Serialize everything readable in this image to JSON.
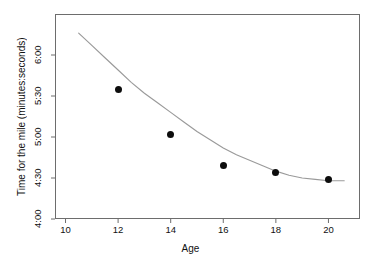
{
  "chart_data": {
    "type": "scatter",
    "title": "",
    "xlabel": "Age",
    "ylabel": "Time for the mile (minutes:seconds)",
    "xlim": [
      9.6,
      21.2
    ],
    "ylim": [
      240,
      390
    ],
    "grid": false,
    "legend": null,
    "x": [
      12,
      14,
      16,
      18,
      20
    ],
    "y_labels": [
      "5:35",
      "5:02",
      "4:39",
      "4:34",
      "4:29"
    ],
    "y_seconds": [
      335,
      302,
      279,
      274,
      269
    ],
    "xticks": [
      10,
      12,
      14,
      16,
      18,
      20
    ],
    "xtick_labels": [
      "10",
      "12",
      "14",
      "16",
      "18",
      "20"
    ],
    "yticks": [
      240,
      270,
      300,
      330,
      360
    ],
    "ytick_labels": [
      "4:00",
      "4:30",
      "5:00",
      "5:30",
      "6:00"
    ],
    "series": [
      {
        "name": "observed times",
        "kind": "points",
        "marker": "filled-circle",
        "color": "#0d0d0d",
        "points": [
          {
            "age": 12,
            "seconds": 335,
            "time": "5:35"
          },
          {
            "age": 14,
            "seconds": 302,
            "time": "5:02"
          },
          {
            "age": 16,
            "seconds": 279,
            "time": "4:39"
          },
          {
            "age": 18,
            "seconds": 274,
            "time": "4:34"
          },
          {
            "age": 20,
            "seconds": 269,
            "time": "4:29"
          }
        ]
      },
      {
        "name": "fitted quadratic curve",
        "kind": "line",
        "color": "#9a9a9a",
        "x_start": 10.5,
        "x_end": 20.6,
        "fit_points": [
          {
            "age": 10.5,
            "seconds": 376
          },
          {
            "age": 11.0,
            "seconds": 367
          },
          {
            "age": 11.5,
            "seconds": 358
          },
          {
            "age": 12.0,
            "seconds": 349
          },
          {
            "age": 12.5,
            "seconds": 340
          },
          {
            "age": 13.0,
            "seconds": 332
          },
          {
            "age": 13.5,
            "seconds": 325
          },
          {
            "age": 14.0,
            "seconds": 318
          },
          {
            "age": 14.5,
            "seconds": 311
          },
          {
            "age": 15.0,
            "seconds": 304
          },
          {
            "age": 15.5,
            "seconds": 298
          },
          {
            "age": 16.0,
            "seconds": 292
          },
          {
            "age": 16.5,
            "seconds": 287
          },
          {
            "age": 17.0,
            "seconds": 283
          },
          {
            "age": 17.5,
            "seconds": 279
          },
          {
            "age": 18.0,
            "seconds": 275
          },
          {
            "age": 18.5,
            "seconds": 272
          },
          {
            "age": 19.0,
            "seconds": 270
          },
          {
            "age": 19.5,
            "seconds": 269
          },
          {
            "age": 20.0,
            "seconds": 268
          },
          {
            "age": 20.6,
            "seconds": 268
          }
        ]
      }
    ]
  },
  "axes": {
    "frame_color": "#6d6d6d",
    "x_title": "Age",
    "y_title": "Time for the mile (minutes:seconds)",
    "x_ticks": [
      {
        "label": "10"
      },
      {
        "label": "12"
      },
      {
        "label": "14"
      },
      {
        "label": "16"
      },
      {
        "label": "18"
      },
      {
        "label": "20"
      }
    ],
    "y_ticks": [
      {
        "label": "4:00"
      },
      {
        "label": "4:30"
      },
      {
        "label": "5:00"
      },
      {
        "label": "5:30"
      },
      {
        "label": "6:00"
      }
    ]
  },
  "colors": {
    "background": "#ffffff",
    "marker": "#0d0d0d",
    "curve": "#9a9a9a",
    "frame": "#6d6d6d",
    "text": "#111111"
  }
}
